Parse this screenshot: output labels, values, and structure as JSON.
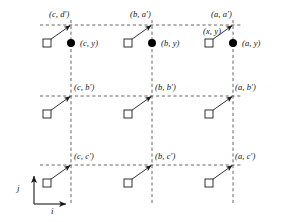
{
  "figure": {
    "background_color": "#ffffff",
    "line_color": "#555555",
    "stroke_color": "#1a1a1a",
    "marker_fill": "#000000"
  },
  "axes": {
    "vertical_label": "j",
    "horizontal_label": "i"
  },
  "grid": {
    "columns": [
      {
        "key": "c",
        "x": 71
      },
      {
        "key": "b",
        "x": 152
      },
      {
        "key": "a",
        "x": 233
      }
    ],
    "rows": [
      {
        "key": "a'",
        "y": 25
      },
      {
        "key": "b'",
        "y": 96
      },
      {
        "key": "c'",
        "y": 165
      }
    ]
  },
  "nodes": [
    {
      "label": "(c, d′)",
      "col": 0,
      "row": 0,
      "lx": 49,
      "ly": 10
    },
    {
      "label": "(b, a′)",
      "col": 1,
      "row": 0,
      "lx": 130,
      "ly": 10
    },
    {
      "label": "(a, a′)",
      "col": 2,
      "row": 0,
      "lx": 211,
      "ly": 10
    },
    {
      "label": "(c, b′)",
      "col": 0,
      "row": 1,
      "lx": 74,
      "ly": 83
    },
    {
      "label": "(b, b′)",
      "col": 1,
      "row": 1,
      "lx": 155,
      "ly": 83
    },
    {
      "label": "(a, b′)",
      "col": 2,
      "row": 1,
      "lx": 235,
      "ly": 83
    },
    {
      "label": "(c, c′)",
      "col": 0,
      "row": 2,
      "lx": 74,
      "ly": 152
    },
    {
      "label": "(b, c′)",
      "col": 1,
      "row": 2,
      "lx": 155,
      "ly": 152
    },
    {
      "label": "(a, c′)",
      "col": 2,
      "row": 2,
      "lx": 235,
      "ly": 152
    }
  ],
  "dots": [
    {
      "label": "(c, y)",
      "cx": 71,
      "cy": 43,
      "lx": 80,
      "ly": 39
    },
    {
      "label": "(b, y)",
      "cx": 152,
      "cy": 43,
      "lx": 161,
      "ly": 39
    },
    {
      "label": "(a, y)",
      "cx": 233,
      "cy": 43,
      "lx": 242,
      "ly": 39
    }
  ],
  "squares": [
    {
      "x": 47,
      "y": 43
    },
    {
      "x": 128,
      "y": 43
    },
    {
      "x": 209,
      "y": 43
    },
    {
      "x": 47,
      "y": 114
    },
    {
      "x": 128,
      "y": 114
    },
    {
      "x": 209,
      "y": 114
    },
    {
      "x": 47,
      "y": 183
    },
    {
      "x": 128,
      "y": 183
    },
    {
      "x": 209,
      "y": 183
    }
  ],
  "pointer_label": {
    "text": "(x, y)",
    "lx": 203,
    "ly": 27
  }
}
